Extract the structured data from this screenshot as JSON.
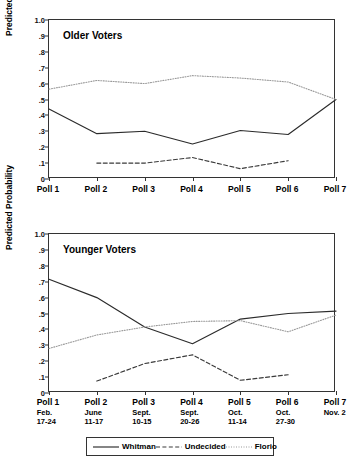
{
  "figure": {
    "background": "#ffffff",
    "ylabel": "Predicted Probability",
    "y_ticks": [
      "1.0",
      ".9",
      ".8",
      ".7",
      ".6",
      ".5",
      ".4",
      ".3",
      ".2",
      ".1",
      "0"
    ]
  },
  "panels": [
    {
      "title": "Older Voters"
    },
    {
      "title": "Younger Voters"
    }
  ],
  "xaxis": {
    "top_labels": [
      "Poll 1",
      "Poll 2",
      "Poll 3",
      "Poll 4",
      "Poll 5",
      "Poll 6",
      "Poll 7"
    ],
    "bottom_labels": [
      {
        "name": "Poll 1",
        "month": "Feb.",
        "days": "17-24"
      },
      {
        "name": "Poll 2",
        "month": "June",
        "days": "11-17"
      },
      {
        "name": "Poll 3",
        "month": "Sept.",
        "days": "10-15"
      },
      {
        "name": "Poll 4",
        "month": "Sept.",
        "days": "20-26"
      },
      {
        "name": "Poll 5",
        "month": "Oct.",
        "days": "11-14"
      },
      {
        "name": "Poll 6",
        "month": "Oct.",
        "days": "27-30"
      },
      {
        "name": "Poll 7",
        "month": "Nov. 2",
        "days": ""
      }
    ]
  },
  "legend": {
    "items": [
      {
        "label": "Whitman",
        "style": "solid",
        "color": "#2b2b2b"
      },
      {
        "label": "Undecided",
        "style": "dashed",
        "color": "#3a3a3a"
      },
      {
        "label": "Florio",
        "style": "dotted",
        "color": "#9a9a9a"
      }
    ]
  },
  "chart_data": [
    {
      "type": "line",
      "title": "Older Voters",
      "xlabel": "",
      "ylabel": "Predicted Probability",
      "categories": [
        "Poll 1",
        "Poll 2",
        "Poll 3",
        "Poll 4",
        "Poll 5",
        "Poll 6",
        "Poll 7"
      ],
      "ylim": [
        0,
        1.0
      ],
      "yticks": [
        0,
        0.1,
        0.2,
        0.3,
        0.4,
        0.5,
        0.6,
        0.7,
        0.8,
        0.9,
        1.0
      ],
      "grid": false,
      "legend_position": "below-figure",
      "series": [
        {
          "name": "Whitman",
          "style": "solid",
          "color": "#2b2b2b",
          "values": [
            0.44,
            0.285,
            0.3,
            0.22,
            0.305,
            0.28,
            0.5
          ]
        },
        {
          "name": "Undecided",
          "style": "dashed",
          "color": "#3a3a3a",
          "values": [
            null,
            0.1,
            0.1,
            0.135,
            0.065,
            0.115,
            null
          ]
        },
        {
          "name": "Florio",
          "style": "dotted",
          "color": "#9a9a9a",
          "values": [
            0.565,
            0.62,
            0.6,
            0.65,
            0.635,
            0.61,
            0.5
          ]
        }
      ]
    },
    {
      "type": "line",
      "title": "Younger Voters",
      "xlabel": "",
      "ylabel": "Predicted Probability",
      "categories": [
        "Poll 1",
        "Poll 2",
        "Poll 3",
        "Poll 4",
        "Poll 5",
        "Poll 6",
        "Poll 7"
      ],
      "ylim": [
        0,
        1.0
      ],
      "yticks": [
        0,
        0.1,
        0.2,
        0.3,
        0.4,
        0.5,
        0.6,
        0.7,
        0.8,
        0.9,
        1.0
      ],
      "grid": false,
      "legend_position": "below-figure",
      "series": [
        {
          "name": "Whitman",
          "style": "solid",
          "color": "#2b2b2b",
          "values": [
            0.715,
            0.6,
            0.415,
            0.31,
            0.465,
            0.5,
            0.515
          ]
        },
        {
          "name": "Undecided",
          "style": "dashed",
          "color": "#3a3a3a",
          "values": [
            null,
            0.075,
            0.185,
            0.24,
            0.08,
            0.115,
            null
          ]
        },
        {
          "name": "Florio",
          "style": "dotted",
          "color": "#9a9a9a",
          "values": [
            0.28,
            0.365,
            0.415,
            0.45,
            0.455,
            0.385,
            0.49
          ]
        }
      ]
    }
  ]
}
